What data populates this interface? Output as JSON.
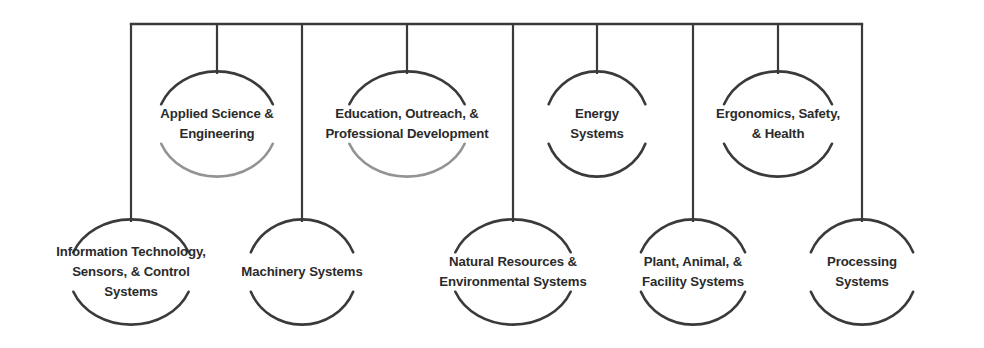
{
  "diagram": {
    "type": "organizational-bracket-chart",
    "title": "",
    "line_color": "#3a3a3a",
    "text_color": "#2b2b2b",
    "background_color": "#ffffff",
    "bus": {
      "x1": 131,
      "x2": 862,
      "y": 24
    },
    "top_row_nodes": [
      {
        "id": "applied-science-engineering",
        "label": "Applied Science &\nEngineering",
        "cx": 217,
        "cy": 124,
        "rx": 60,
        "ry": 52,
        "drop_from_y": 24,
        "faded_bottom_arc": true
      },
      {
        "id": "education-outreach-professional-development",
        "label": "Education, Outreach, &\nProfessional Development",
        "cx": 407,
        "cy": 124,
        "rx": 62,
        "ry": 52,
        "drop_from_y": 24,
        "faded_bottom_arc": true
      },
      {
        "id": "energy-systems",
        "label": "Energy\nSystems",
        "cx": 597,
        "cy": 124,
        "rx": 52,
        "ry": 52,
        "drop_from_y": 24,
        "faded_bottom_arc": false
      },
      {
        "id": "ergonomics-safety-health",
        "label": "Ergonomics, Safety,\n& Health",
        "cx": 778,
        "cy": 124,
        "rx": 58,
        "ry": 52,
        "drop_from_y": 24,
        "faded_bottom_arc": false
      }
    ],
    "bottom_row_nodes": [
      {
        "id": "information-technology-sensors-control-systems",
        "label": "Information Technology,\nSensors, & Control\nSystems",
        "cx": 131,
        "cy": 272,
        "rx": 62,
        "ry": 52,
        "drop_from_y": 24
      },
      {
        "id": "machinery-systems",
        "label": "Machinery Systems",
        "cx": 302,
        "cy": 272,
        "rx": 55,
        "ry": 52,
        "drop_from_y": 24
      },
      {
        "id": "natural-resources-environmental-systems",
        "label": "Natural Resources &\nEnvironmental Systems",
        "cx": 513,
        "cy": 272,
        "rx": 62,
        "ry": 52,
        "drop_from_y": 24
      },
      {
        "id": "plant-animal-facility-systems",
        "label": "Plant, Animal, &\nFacility Systems",
        "cx": 693,
        "cy": 272,
        "rx": 56,
        "ry": 52,
        "drop_from_y": 24
      },
      {
        "id": "processing-systems",
        "label": "Processing Systems",
        "cx": 862,
        "cy": 272,
        "rx": 55,
        "ry": 52,
        "drop_from_y": 24
      }
    ]
  }
}
